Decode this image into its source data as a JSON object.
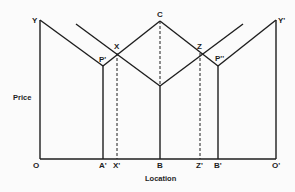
{
  "diagram": {
    "type": "spatial-price-diagram",
    "y_axis_label": "Price",
    "x_axis_label": "Location",
    "point_labels": {
      "Y": "Y",
      "Y2": "Y'",
      "P1": "P'",
      "P2": "P''",
      "X": "X",
      "C": "C",
      "Z": "Z"
    },
    "axis_labels": [
      "O",
      "A'",
      "X'",
      "B",
      "Z'",
      "B'",
      "O'"
    ],
    "line_color": "#1e1e1e"
  }
}
